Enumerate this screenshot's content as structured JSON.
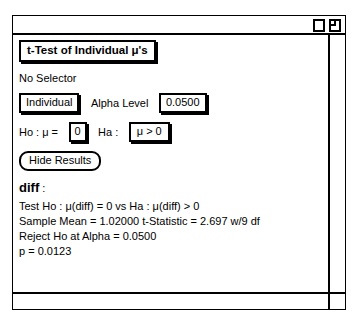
{
  "window": {
    "title": "",
    "zoom_box_icon": "zoom-box-icon",
    "grow_box_icon": "grow-box-icon"
  },
  "panel": {
    "title_button": "t-Test of Individual μ's",
    "selector_label": "No Selector",
    "mode_button": "Individual",
    "alpha_label": "Alpha Level",
    "alpha_value": "0.0500",
    "ho_label": "Ho : μ =",
    "ho_value": "0",
    "ha_label": "Ha :",
    "ha_value": "μ > 0",
    "hide_results_button": "Hide Results"
  },
  "results": {
    "variable_name": "diff",
    "variable_colon": " :",
    "lines": [
      "Test Ho : μ(diff) = 0 vs Ha : μ(diff) > 0",
      "Sample Mean = 1.02000  t-Statistic = 2.697 w/9 df",
      "Reject Ho at Alpha = 0.0500",
      "p = 0.0123"
    ]
  },
  "scrollbars": {
    "vertical": "vertical-scrollbar",
    "horizontal": "horizontal-scrollbar"
  }
}
